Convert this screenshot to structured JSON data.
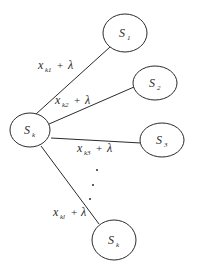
{
  "diagram": {
    "type": "star-graph",
    "stroke_color": "#2a2a2a",
    "background": "#ffffff",
    "center_node": {
      "id": "Sk",
      "base": "S",
      "sub": "k",
      "cx": 30,
      "cy": 130,
      "rx": 20,
      "ry": 17
    },
    "nodes": [
      {
        "id": "S1",
        "base": "S",
        "sub": "1",
        "cx": 125,
        "cy": 33,
        "rx": 22,
        "ry": 19
      },
      {
        "id": "S2",
        "base": "S",
        "sub": "2",
        "cx": 155,
        "cy": 83,
        "rx": 22,
        "ry": 17
      },
      {
        "id": "S3",
        "base": "S",
        "sub": "3",
        "cx": 162,
        "cy": 140,
        "rx": 22,
        "ry": 17
      },
      {
        "id": "Sk_end",
        "base": "S",
        "sub": "k",
        "cx": 114,
        "cy": 240,
        "rx": 22,
        "ry": 20
      }
    ],
    "edges": [
      {
        "from": "Sk",
        "to": "S1",
        "label_base": "x",
        "label_sub": "k1",
        "label_op": "+",
        "label_lambda": "λ"
      },
      {
        "from": "Sk",
        "to": "S2",
        "label_base": "x",
        "label_sub": "k2",
        "label_op": "+",
        "label_lambda": "λ"
      },
      {
        "from": "Sk",
        "to": "S3",
        "label_base": "x",
        "label_sub": "k3",
        "label_op": "+",
        "label_lambda": "λ"
      },
      {
        "from": "Sk",
        "to": "Sk_end",
        "label_base": "x",
        "label_sub": "kl",
        "label_op": "+",
        "label_lambda": "λ"
      }
    ],
    "ellipsis": "⋮"
  }
}
